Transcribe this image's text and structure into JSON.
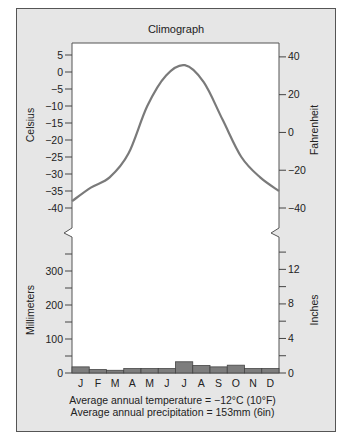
{
  "header_cutoff_text": "(ft  m, 33l  ft)",
  "chart_data": {
    "type": "climograph",
    "title": "Climograph",
    "categories": [
      "J",
      "F",
      "M",
      "A",
      "M",
      "J",
      "J",
      "A",
      "S",
      "O",
      "N",
      "D"
    ],
    "series": [
      {
        "name": "Temperature",
        "type": "line",
        "unit": "°C",
        "values": [
          -38,
          -34,
          -31,
          -24,
          -10,
          -1,
          2,
          -3,
          -14,
          -25,
          -31,
          -35
        ]
      },
      {
        "name": "Precipitation",
        "type": "bar",
        "unit": "mm",
        "values": [
          18,
          10,
          8,
          13,
          13,
          13,
          33,
          22,
          18,
          23,
          13,
          13
        ]
      }
    ],
    "left_axis_top": {
      "label": "Celsius",
      "ticks": [
        "5",
        "0",
        "−5",
        "−10",
        "−15",
        "−20",
        "−25",
        "−30",
        "−35",
        "-40"
      ],
      "range": [
        -40,
        5
      ]
    },
    "right_axis_top": {
      "label": "Fahrenheit",
      "ticks": [
        "40",
        "20",
        "0",
        "−20",
        "−40"
      ]
    },
    "left_axis_bottom": {
      "label": "Millimeters",
      "ticks": [
        "300",
        "200",
        "100",
        "0"
      ],
      "range": [
        0,
        350
      ]
    },
    "right_axis_bottom": {
      "label": "Inches",
      "ticks": [
        "12",
        "8",
        "4",
        "0"
      ]
    },
    "grid": false,
    "colors": {
      "line": "#7a7a7a",
      "bar": "#7d7d7d",
      "panel": "#e6e6e6",
      "plot": "#ffffff"
    }
  },
  "footer": {
    "temperature": "Average annual temperature = −12°C (10°F)",
    "precipitation": "Average annual precipitation = 153mm (6in)"
  }
}
